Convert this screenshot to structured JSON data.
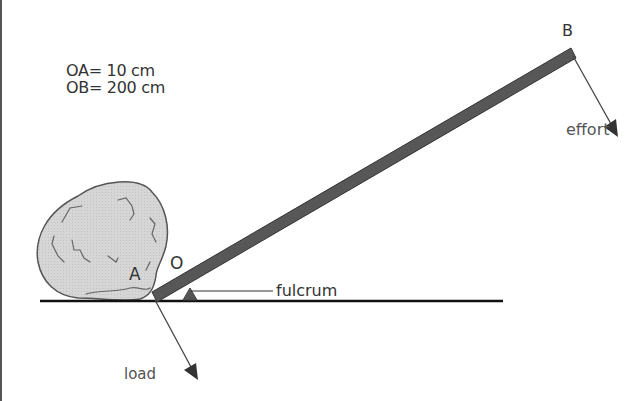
{
  "diagram": {
    "type": "lever (class 1) lifting a rock",
    "given": {
      "line1": "OA= 10 cm",
      "line2": "OB= 200 cm"
    },
    "labels": {
      "point_b": "B",
      "point_a": "A",
      "point_o": "O",
      "effort": "effort",
      "fulcrum": "fulcrum",
      "load": "load"
    },
    "colors": {
      "lever_fill": "#555555",
      "rock_fill": "#d4d4d4",
      "rock_outline": "#555555",
      "ground": "#111111",
      "arrow": "#444444",
      "text": "#333333",
      "border": "#555555"
    },
    "geometry": {
      "ground": {
        "x1": 40,
        "y1": 301,
        "x2": 503,
        "y2": 301
      },
      "lever": {
        "x1": 155,
        "y1": 297,
        "x2": 573,
        "y2": 53,
        "thickness": 11
      },
      "fulcrum_apex": [
        190,
        289
      ],
      "effort_arrow": {
        "from": [
          573,
          56
        ],
        "to": [
          618,
          136
        ]
      },
      "load_arrow": {
        "from": [
          155,
          300
        ],
        "to": [
          198,
          380
        ]
      }
    }
  }
}
